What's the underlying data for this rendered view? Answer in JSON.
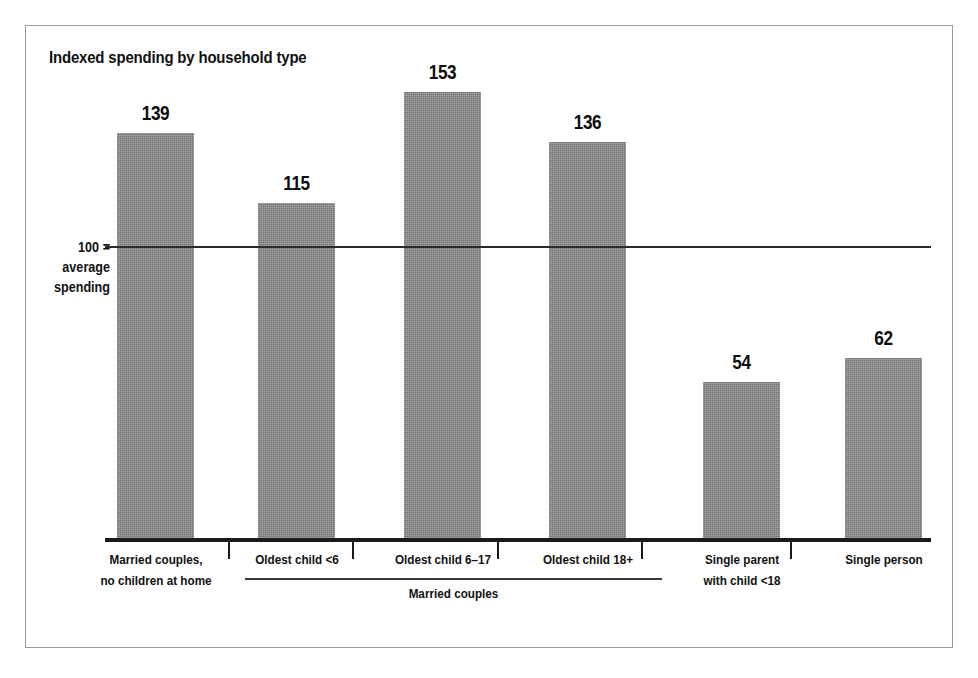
{
  "chart_data": {
    "type": "bar",
    "title": "Indexed spending by household type",
    "xlabel": "",
    "ylabel": "100 = average spending",
    "ylim": [
      0,
      160
    ],
    "grid": false,
    "legend": null,
    "reference_line": {
      "value": 100,
      "label_line1": "100 =",
      "label_line2": "average",
      "label_line3": "spending"
    },
    "categories": [
      "Married couples, no children at home",
      "Oldest child <6",
      "Oldest child 6–17",
      "Oldest child 18+",
      "Single parent with child <18",
      "Single person"
    ],
    "values": [
      139,
      115,
      153,
      136,
      54,
      62
    ],
    "annotations": [
      {
        "text": "Married couples",
        "covers": [
          "Oldest child <6",
          "Oldest child 6–17",
          "Oldest child 18+"
        ]
      }
    ]
  },
  "bars": [
    {
      "value_label": "139",
      "label_line1": "Married couples,",
      "label_line2": "no children at home"
    },
    {
      "value_label": "115",
      "label_line1": "Oldest child <6",
      "label_line2": ""
    },
    {
      "value_label": "153",
      "label_line1": "Oldest child 6–17",
      "label_line2": ""
    },
    {
      "value_label": "136",
      "label_line1": "Oldest child 18+",
      "label_line2": ""
    },
    {
      "value_label": "54",
      "label_line1": "Single parent",
      "label_line2": "with child <18"
    },
    {
      "value_label": "62",
      "label_line1": "Single person",
      "label_line2": ""
    }
  ],
  "group": {
    "label": "Married couples"
  },
  "colors": {
    "bar_fill": "#8c8c8c",
    "axis": "#1a1a1a",
    "reference_line": "#2a2a2a",
    "text": "#111111",
    "frame": "#9a9a9a",
    "background": "#ffffff"
  }
}
